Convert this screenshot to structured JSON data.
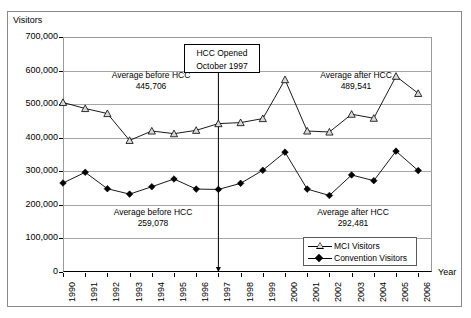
{
  "chart_data": {
    "type": "line",
    "title": "",
    "xlabel": "Year",
    "ylabel": "Visitors",
    "ylim": [
      0,
      700000
    ],
    "grid": true,
    "legend_position": "bottom-right",
    "categories": [
      "1990",
      "1991",
      "1992",
      "1993",
      "1994",
      "1995",
      "1996",
      "1997",
      "1998",
      "1999",
      "2000",
      "2001",
      "2002",
      "2003",
      "2004",
      "2005",
      "2006"
    ],
    "ytick_labels": [
      "700,000",
      "600,000",
      "500,000",
      "400,000",
      "300,000",
      "200,000",
      "100,000",
      "0"
    ],
    "ytick_values": [
      700000,
      600000,
      500000,
      400000,
      300000,
      200000,
      100000,
      0
    ],
    "series": [
      {
        "name": "MCI Visitors",
        "marker": "triangle-open",
        "values": [
          505000,
          487000,
          472000,
          392000,
          420000,
          412000,
          422000,
          442000,
          445000,
          457000,
          573000,
          420000,
          417000,
          470000,
          458000,
          583000,
          532000
        ]
      },
      {
        "name": "Convention Visitors",
        "marker": "diamond-filled",
        "values": [
          265000,
          297000,
          248000,
          232000,
          254000,
          277000,
          247000,
          246000,
          264000,
          303000,
          357000,
          247000,
          228000,
          289000,
          272000,
          360000,
          302000
        ]
      }
    ],
    "annotations": [
      {
        "id": "mci-before",
        "line1": "Average before HCC",
        "line2": "445,706",
        "value": 445706
      },
      {
        "id": "mci-after",
        "line1": "Average after HCC",
        "line2": "489,541",
        "value": 489541
      },
      {
        "id": "conv-before",
        "line1": "Average before HCC",
        "line2": "259,078",
        "value": 259078
      },
      {
        "id": "conv-after",
        "line1": "Average after HCC",
        "line2": "292,481",
        "value": 292481
      }
    ],
    "callout": {
      "line1": "HCC Opened",
      "line2": "October 1997",
      "marker_year": "1997"
    }
  },
  "axis": {
    "y_title": "Visitors",
    "x_title": "Year"
  },
  "legend": {
    "items": [
      {
        "label": "MCI Visitors"
      },
      {
        "label": "Convention Visitors"
      }
    ]
  },
  "colors": {
    "series_line": "#000000",
    "grid": "#a6a6a6",
    "frame": "#8a8a8a",
    "marker_fill": "#d9d9d9"
  }
}
